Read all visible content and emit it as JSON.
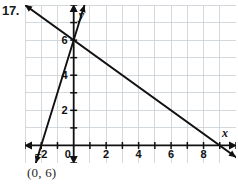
{
  "problem": {
    "number": "17.",
    "answer": "(0, 6)"
  },
  "chart_data": {
    "type": "line",
    "title": "",
    "xlabel": "x",
    "ylabel": "y",
    "xlim": [
      -3,
      10
    ],
    "ylim": [
      -1,
      8
    ],
    "grid": true,
    "grid_step": 1,
    "legend": "none",
    "x_ticks": [
      -2,
      0,
      2,
      4,
      6,
      8
    ],
    "x_tick_labels": [
      "–2",
      "0",
      "2",
      "4",
      "6",
      "8"
    ],
    "y_ticks": [
      2,
      4,
      6
    ],
    "y_tick_labels": [
      "2",
      "4",
      "6"
    ],
    "series": [
      {
        "name": "steep-line",
        "equation": "y = 3x + 6",
        "slope": 3,
        "intercept": 6,
        "points": [
          [
            -2,
            0
          ],
          [
            0,
            6
          ]
        ],
        "arrows": "both",
        "color": "#111111"
      },
      {
        "name": "shallow-line",
        "equation": "y = -2/3x + 6",
        "slope": -0.6667,
        "intercept": 6,
        "points": [
          [
            0,
            6
          ],
          [
            9,
            0
          ]
        ],
        "arrows": "both",
        "color": "#111111"
      }
    ],
    "annotations": [
      {
        "name": "intersection",
        "x": 0,
        "y": 6,
        "label": "(0, 6)"
      }
    ],
    "colors": {
      "grid": "#c9cfd6",
      "axis": "#111111",
      "line": "#111111",
      "background": "#ffffff"
    }
  }
}
